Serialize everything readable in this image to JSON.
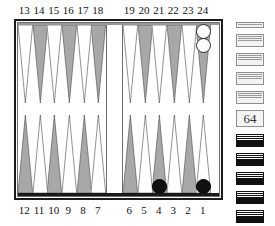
{
  "board": {
    "title": "Backgammon board position diagram",
    "top_point_labels": [
      "13",
      "14",
      "15",
      "16",
      "17",
      "18",
      "19",
      "20",
      "21",
      "22",
      "23",
      "24"
    ],
    "bottom_point_labels": [
      "12",
      "11",
      "10",
      "9",
      "8",
      "7",
      "6",
      "5",
      "4",
      "3",
      "2",
      "1"
    ],
    "colors": {
      "frame": "#1a1a1a",
      "inner_border": "#6d6d6d",
      "point_dark": "#a8a8a8",
      "point_light": "#ffffff",
      "checker_white": "#ffffff",
      "checker_black": "#111111",
      "background": "#ffffff"
    },
    "top_points": [
      {
        "num": "13",
        "shade": "light",
        "checkers": 0,
        "color": ""
      },
      {
        "num": "14",
        "shade": "dark",
        "checkers": 0,
        "color": ""
      },
      {
        "num": "15",
        "shade": "light",
        "checkers": 0,
        "color": ""
      },
      {
        "num": "16",
        "shade": "dark",
        "checkers": 0,
        "color": ""
      },
      {
        "num": "17",
        "shade": "light",
        "checkers": 0,
        "color": ""
      },
      {
        "num": "18",
        "shade": "dark",
        "checkers": 0,
        "color": ""
      },
      {
        "num": "19",
        "shade": "light",
        "checkers": 0,
        "color": ""
      },
      {
        "num": "20",
        "shade": "dark",
        "checkers": 0,
        "color": ""
      },
      {
        "num": "21",
        "shade": "light",
        "checkers": 0,
        "color": ""
      },
      {
        "num": "22",
        "shade": "dark",
        "checkers": 0,
        "color": ""
      },
      {
        "num": "23",
        "shade": "light",
        "checkers": 0,
        "color": ""
      },
      {
        "num": "24",
        "shade": "dark",
        "checkers": 2,
        "color": "white"
      }
    ],
    "bottom_points": [
      {
        "num": "12",
        "shade": "dark",
        "checkers": 0,
        "color": ""
      },
      {
        "num": "11",
        "shade": "light",
        "checkers": 0,
        "color": ""
      },
      {
        "num": "10",
        "shade": "dark",
        "checkers": 0,
        "color": ""
      },
      {
        "num": "9",
        "shade": "light",
        "checkers": 0,
        "color": ""
      },
      {
        "num": "8",
        "shade": "dark",
        "checkers": 0,
        "color": ""
      },
      {
        "num": "7",
        "shade": "light",
        "checkers": 0,
        "color": ""
      },
      {
        "num": "6",
        "shade": "dark",
        "checkers": 0,
        "color": ""
      },
      {
        "num": "5",
        "shade": "light",
        "checkers": 0,
        "color": ""
      },
      {
        "num": "4",
        "shade": "dark",
        "checkers": 1,
        "color": "black"
      },
      {
        "num": "3",
        "shade": "light",
        "checkers": 0,
        "color": ""
      },
      {
        "num": "2",
        "shade": "dark",
        "checkers": 0,
        "color": ""
      },
      {
        "num": "1",
        "shade": "light",
        "checkers": 1,
        "color": "black"
      }
    ]
  },
  "tray": {
    "cube_value": "64",
    "light_stacks": [
      {
        "bands": 1
      },
      {
        "bands": 3
      },
      {
        "bands": 3
      },
      {
        "bands": 3
      },
      {
        "bands": 3
      }
    ],
    "dark_stacks": [
      {
        "bands": 3
      },
      {
        "bands": 3
      },
      {
        "bands": 3
      },
      {
        "bands": 3
      },
      {
        "bands": 3
      },
      {
        "bands": 1
      }
    ]
  }
}
